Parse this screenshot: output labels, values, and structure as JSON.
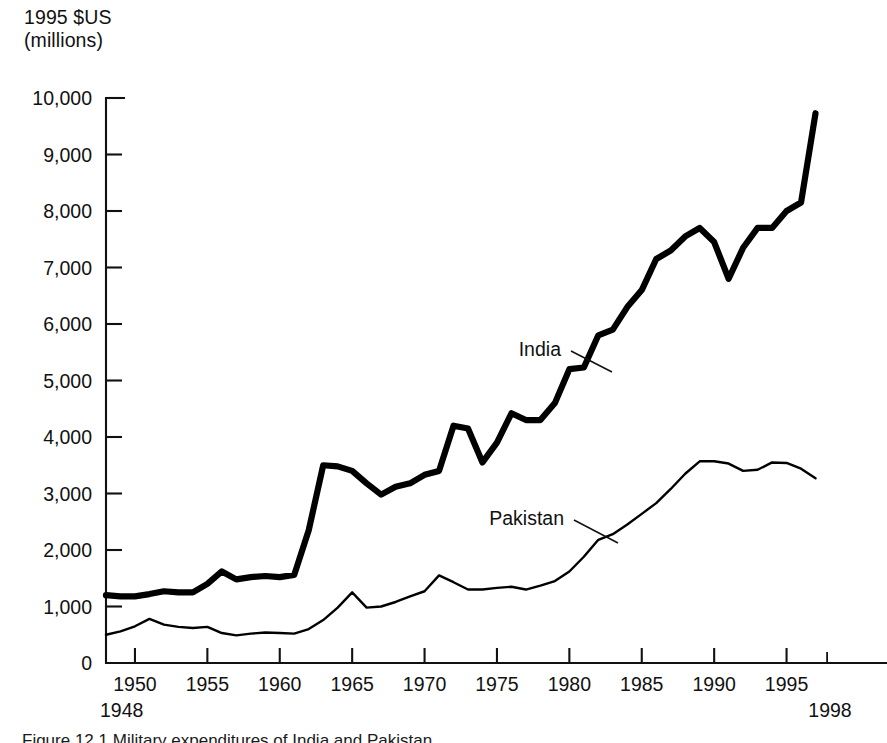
{
  "figure": {
    "axis_title_line1": "1995 $US",
    "axis_title_line2": "(millions)",
    "caption_partial": "Figure 12.1  Military expenditures of India and Pakistan"
  },
  "labels": {
    "india": "India",
    "pakistan": "Pakistan",
    "start_year": "1948",
    "end_year": "1998"
  },
  "chart_data": {
    "type": "line",
    "title": "",
    "subtitle": "",
    "xlabel": "",
    "ylabel": "1995 $US (millions)",
    "grid": false,
    "legend_position": "inline-annotations",
    "xlim": [
      1948,
      1998
    ],
    "ylim": [
      0,
      10000
    ],
    "ytick_labels": [
      "0",
      "1,000",
      "2,000",
      "3,000",
      "4,000",
      "5,000",
      "6,000",
      "7,000",
      "8,000",
      "9,000",
      "10,000"
    ],
    "ytick_values": [
      0,
      1000,
      2000,
      3000,
      4000,
      5000,
      6000,
      7000,
      8000,
      9000,
      10000
    ],
    "xtick_labels": [
      "1950",
      "1955",
      "1960",
      "1965",
      "1970",
      "1975",
      "1980",
      "1985",
      "1990",
      "1995"
    ],
    "xtick_values": [
      1950,
      1955,
      1960,
      1965,
      1970,
      1975,
      1980,
      1985,
      1990,
      1995
    ],
    "x_endpoint_labels": [
      "1948",
      "1998"
    ],
    "x": [
      1948,
      1949,
      1950,
      1951,
      1952,
      1953,
      1954,
      1955,
      1956,
      1957,
      1958,
      1959,
      1960,
      1961,
      1962,
      1963,
      1964,
      1965,
      1966,
      1967,
      1968,
      1969,
      1970,
      1971,
      1972,
      1973,
      1974,
      1975,
      1976,
      1977,
      1978,
      1979,
      1980,
      1981,
      1982,
      1983,
      1984,
      1985,
      1986,
      1987,
      1988,
      1989,
      1990,
      1991,
      1992,
      1993,
      1994,
      1995,
      1996,
      1997
    ],
    "series": [
      {
        "name": "India",
        "line_weight": "thick",
        "color": "#000000",
        "values": [
          1200,
          1180,
          1180,
          1220,
          1270,
          1250,
          1250,
          1400,
          1620,
          1480,
          1520,
          1540,
          1520,
          1560,
          2350,
          3500,
          3480,
          3400,
          3180,
          2980,
          3120,
          3180,
          3330,
          3400,
          4200,
          4150,
          3550,
          3900,
          4420,
          4300,
          4300,
          4600,
          5200,
          5230,
          5800,
          5900,
          6300,
          6600,
          7150,
          7300,
          7550,
          7700,
          7450,
          6800,
          7350,
          7700,
          7700,
          8000,
          8150,
          9730
        ]
      },
      {
        "name": "Pakistan",
        "line_weight": "thin",
        "color": "#000000",
        "values": [
          500,
          560,
          650,
          780,
          680,
          640,
          620,
          640,
          530,
          490,
          520,
          540,
          530,
          520,
          600,
          760,
          980,
          1250,
          980,
          1000,
          1080,
          1180,
          1270,
          1550,
          1430,
          1300,
          1300,
          1330,
          1350,
          1300,
          1370,
          1450,
          1620,
          1880,
          2180,
          2280,
          2450,
          2640,
          2830,
          3080,
          3350,
          3570,
          3570,
          3530,
          3400,
          3420,
          3550,
          3540,
          3440,
          3270
        ]
      }
    ],
    "annotations": [
      {
        "text": "India",
        "points_to_year": 1980,
        "points_to_value": 5200
      },
      {
        "text": "Pakistan",
        "points_to_year": 1983,
        "points_to_value": 2280
      }
    ]
  }
}
